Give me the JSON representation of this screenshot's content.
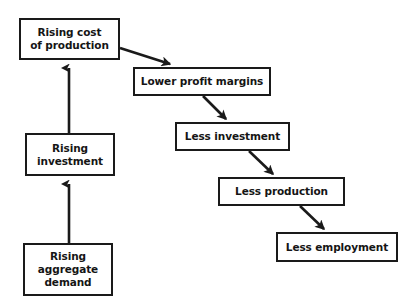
{
  "diagram": {
    "type": "flowchart",
    "background_color": "#ffffff",
    "line_color": "#1a1a1a",
    "text_color": "#151515",
    "nodes": [
      {
        "id": "rising-cost-of-production",
        "label": "Rising cost\nof production"
      },
      {
        "id": "rising-investment",
        "label": "Rising\ninvestment"
      },
      {
        "id": "rising-aggregate-demand",
        "label": "Rising\naggregate\ndemand"
      },
      {
        "id": "lower-profit-margins",
        "label": "Lower profit margins"
      },
      {
        "id": "less-investment",
        "label": "Less investment"
      },
      {
        "id": "less-production",
        "label": "Less production"
      },
      {
        "id": "less-employment",
        "label": "Less employment"
      }
    ],
    "edges": [
      {
        "id": "edge-aggregate-demand-to-investment",
        "from": "rising-aggregate-demand",
        "to": "rising-investment",
        "direction": "up"
      },
      {
        "id": "edge-investment-to-cost",
        "from": "rising-investment",
        "to": "rising-cost-of-production",
        "direction": "up"
      },
      {
        "id": "edge-cost-to-margins",
        "from": "rising-cost-of-production",
        "to": "lower-profit-margins",
        "direction": "down-right"
      },
      {
        "id": "edge-margins-to-less-investment",
        "from": "lower-profit-margins",
        "to": "less-investment",
        "direction": "down-right"
      },
      {
        "id": "edge-less-investment-to-production",
        "from": "less-investment",
        "to": "less-production",
        "direction": "down-right"
      },
      {
        "id": "edge-less-production-to-employment",
        "from": "less-production",
        "to": "less-employment",
        "direction": "down-right"
      }
    ]
  }
}
